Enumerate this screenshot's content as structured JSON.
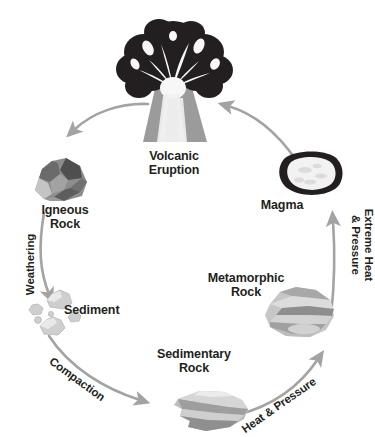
{
  "diagram": {
    "background_color": "#ffffff",
    "arrow_color": "#a3a3a3",
    "text_color": "#231f20",
    "nodes": [
      {
        "id": "volcanic-eruption",
        "label": "Volcanic\nEruption",
        "icon": "volcano-icon"
      },
      {
        "id": "igneous-rock",
        "label": "Igneous\nRock",
        "icon": "igneous-rock-icon"
      },
      {
        "id": "sediment",
        "label": "Sediment",
        "icon": "sediment-pebbles-icon"
      },
      {
        "id": "sedimentary-rock",
        "label": "Sedimentary\nRock",
        "icon": "sedimentary-rock-icon"
      },
      {
        "id": "metamorphic-rock",
        "label": "Metamorphic\nRock",
        "icon": "metamorphic-rock-icon"
      },
      {
        "id": "magma",
        "label": "Magma",
        "icon": "magma-icon"
      }
    ],
    "processes": [
      {
        "id": "weathering",
        "label": "Weathering",
        "from": "igneous-rock",
        "to": "sediment"
      },
      {
        "id": "compaction",
        "label": "Compaction",
        "from": "sediment",
        "to": "sedimentary-rock"
      },
      {
        "id": "heat-and-pressure",
        "label": "Heat & Pressure",
        "from": "sedimentary-rock",
        "to": "metamorphic-rock"
      },
      {
        "id": "extreme-heat-and-pressure",
        "label": "Extreme Heat\n& Pressure",
        "from": "metamorphic-rock",
        "to": "magma"
      },
      {
        "id": "melting",
        "label": "",
        "from": "magma",
        "to": "volcanic-eruption"
      },
      {
        "id": "cooling",
        "label": "",
        "from": "volcanic-eruption",
        "to": "igneous-rock"
      }
    ]
  }
}
